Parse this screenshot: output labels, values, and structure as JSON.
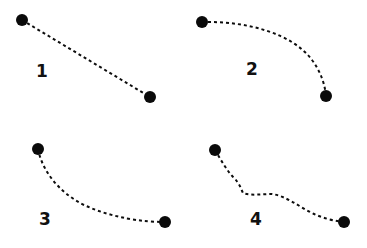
{
  "figure": {
    "background_color": "#ffffff",
    "ink_color": "#0d0d0d",
    "width": 367,
    "height": 248,
    "has_axes": false,
    "has_frame": false,
    "has_gridlines": false,
    "layout": "2x2 grid of unframed panels"
  },
  "style": {
    "line_style": "dashed",
    "dash_on_px": 3,
    "dash_off_px": 3,
    "stroke_width_px": 2,
    "marker_shape": "filled-circle",
    "marker_radius_px": 6,
    "marker_color": "#0a0a0a",
    "label_font_size_px": 17,
    "label_color": "#111111"
  },
  "chart_data": {
    "type": "line",
    "title": "",
    "subtitle": "",
    "xlabel": "",
    "ylabel": "",
    "xlim": [
      0,
      367
    ],
    "ylim": [
      248,
      0
    ],
    "grid": false,
    "legend": "none",
    "note": "Four small multiples, each a dashed trajectory between two filled circular endpoint markers. Coordinates are in image pixel space with y increasing downward.",
    "series": [
      {
        "name": "1",
        "label": "1",
        "label_position": {
          "x": 42,
          "y": 72
        },
        "shape": "straight descending segment",
        "start_point": {
          "x": 22,
          "y": 20
        },
        "end_point": {
          "x": 150,
          "y": 97
        },
        "path": "M22,20 L150,97",
        "points": [
          {
            "x": 22,
            "y": 20
          },
          {
            "x": 54,
            "y": 39
          },
          {
            "x": 86,
            "y": 58
          },
          {
            "x": 118,
            "y": 78
          },
          {
            "x": 150,
            "y": 97
          }
        ]
      },
      {
        "name": "2",
        "label": "2",
        "label_position": {
          "x": 252,
          "y": 70
        },
        "shape": "convex curve: flat start then steep drop",
        "start_point": {
          "x": 202,
          "y": 22
        },
        "end_point": {
          "x": 326,
          "y": 96
        },
        "path": "M202,22 C246,21 292,33 312,60 C321,72 325,85 326,96",
        "points": [
          {
            "x": 202,
            "y": 22
          },
          {
            "x": 236,
            "y": 25
          },
          {
            "x": 268,
            "y": 36
          },
          {
            "x": 296,
            "y": 55
          },
          {
            "x": 313,
            "y": 75
          },
          {
            "x": 326,
            "y": 96
          }
        ]
      },
      {
        "name": "3",
        "label": "3",
        "label_position": {
          "x": 45,
          "y": 220
        },
        "shape": "concave decay: steep start then flattening",
        "start_point": {
          "x": 38,
          "y": 149
        },
        "end_point": {
          "x": 165,
          "y": 222
        },
        "path": "M38,149 C42,170 58,192 84,205 C112,218 143,222 165,222",
        "points": [
          {
            "x": 38,
            "y": 149
          },
          {
            "x": 52,
            "y": 174
          },
          {
            "x": 74,
            "y": 195
          },
          {
            "x": 102,
            "y": 210
          },
          {
            "x": 133,
            "y": 219
          },
          {
            "x": 165,
            "y": 222
          }
        ]
      },
      {
        "name": "4",
        "label": "4",
        "label_position": {
          "x": 256,
          "y": 220
        },
        "shape": "wavy descending path with a mid step and gentle S-curve",
        "start_point": {
          "x": 215,
          "y": 150
        },
        "end_point": {
          "x": 344,
          "y": 222
        },
        "path": "M215,150 C222,162 228,172 234,178 C240,184 241,189 243,193 C252,196 262,194 272,194 C286,196 298,206 312,213 C322,218 334,221 344,222",
        "points": [
          {
            "x": 215,
            "y": 150
          },
          {
            "x": 231,
            "y": 175
          },
          {
            "x": 243,
            "y": 193
          },
          {
            "x": 262,
            "y": 194
          },
          {
            "x": 281,
            "y": 199
          },
          {
            "x": 305,
            "y": 210
          },
          {
            "x": 325,
            "y": 218
          },
          {
            "x": 344,
            "y": 222
          }
        ]
      }
    ]
  }
}
